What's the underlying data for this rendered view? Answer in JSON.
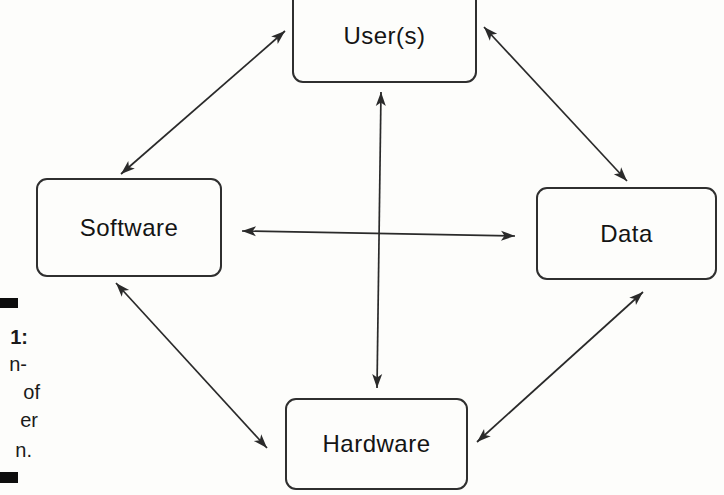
{
  "diagram": {
    "title_hint": "four-component computer system diagram",
    "ink_color": "#2a2a2a",
    "nodes": [
      {
        "id": "users",
        "label": "User(s)"
      },
      {
        "id": "software",
        "label": "Software"
      },
      {
        "id": "data",
        "label": "Data"
      },
      {
        "id": "hardware",
        "label": "Hardware"
      }
    ],
    "edges": [
      {
        "from": "users",
        "to": "software",
        "bidirectional": true,
        "x1": 285,
        "y1": 31,
        "x2": 121,
        "y2": 174
      },
      {
        "from": "users",
        "to": "data",
        "bidirectional": true,
        "x1": 484,
        "y1": 27,
        "x2": 627,
        "y2": 181
      },
      {
        "from": "users",
        "to": "hardware",
        "bidirectional": true,
        "x1": 381,
        "y1": 92,
        "x2": 377,
        "y2": 388
      },
      {
        "from": "software",
        "to": "data",
        "bidirectional": true,
        "x1": 242,
        "y1": 231,
        "x2": 515,
        "y2": 236
      },
      {
        "from": "software",
        "to": "hardware",
        "bidirectional": true,
        "x1": 116,
        "y1": 283,
        "x2": 267,
        "y2": 448
      },
      {
        "from": "data",
        "to": "hardware",
        "bidirectional": true,
        "x1": 643,
        "y1": 292,
        "x2": 477,
        "y2": 442
      }
    ]
  },
  "caption": {
    "visible_fragments": [
      {
        "text": "1:",
        "bold": true
      },
      {
        "text": "n-",
        "bold": false
      },
      {
        "text": "of",
        "bold": false
      },
      {
        "text": "er",
        "bold": false
      },
      {
        "text": "n.",
        "bold": false
      }
    ]
  }
}
